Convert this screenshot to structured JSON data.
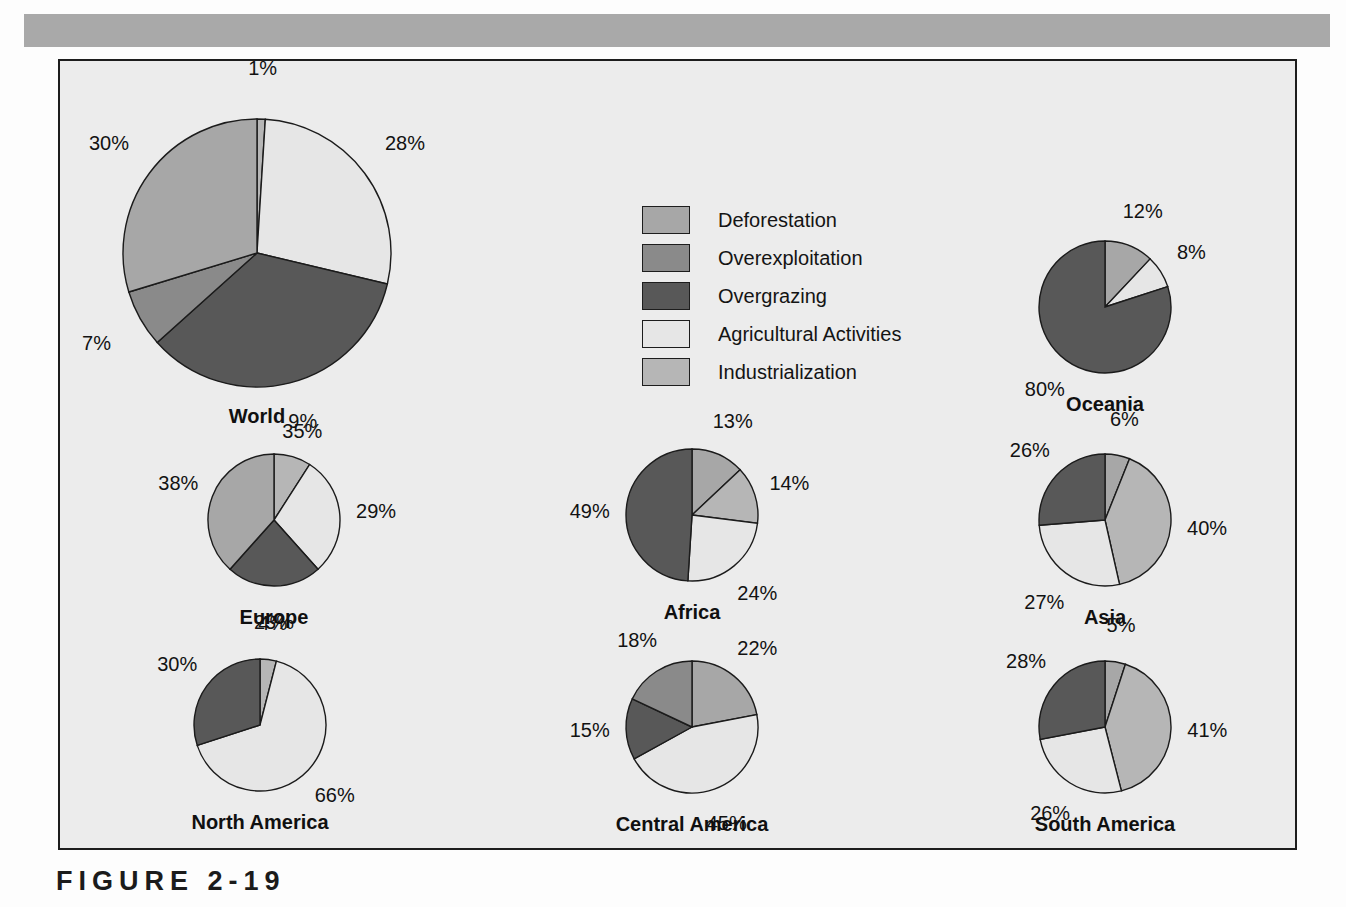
{
  "caption": "FIGURE 2-19",
  "colors": {
    "page_background": "#fdfdfd",
    "panel_background": "#ececec",
    "top_band": "#a9a9a9",
    "frame_border": "#1d1d1d",
    "deforestation": "#a7a7a7",
    "overexploitation": "#8a8a8a",
    "overgrazing": "#585858",
    "agricultural": "#e6e6e6",
    "industrialization": "#b6b6b6"
  },
  "legend": {
    "items": [
      {
        "label": "Deforestation",
        "color": "#a7a7a7"
      },
      {
        "label": "Overexploitation",
        "color": "#8a8a8a"
      },
      {
        "label": "Overgrazing",
        "color": "#585858"
      },
      {
        "label": "Agricultural Activities",
        "color": "#e6e6e6"
      },
      {
        "label": "Industrialization",
        "color": "#b6b6b6"
      }
    ]
  },
  "chart_data": {
    "type": "pie",
    "title": "FIGURE 2-19",
    "xlabel": "",
    "ylabel": "",
    "grid": false,
    "legend_position": "top-center",
    "units": "percent",
    "categories": [
      "Deforestation",
      "Overexploitation",
      "Overgrazing",
      "Agricultural Activities",
      "Industrialization"
    ],
    "charts": [
      {
        "name": "World",
        "slices": [
          {
            "label": "1%",
            "value": 1,
            "category": "Industrialization"
          },
          {
            "label": "28%",
            "value": 28,
            "category": "Agricultural Activities"
          },
          {
            "label": "35%",
            "value": 35,
            "category": "Overgrazing"
          },
          {
            "label": "7%",
            "value": 7,
            "category": "Overexploitation"
          },
          {
            "label": "30%",
            "value": 30,
            "category": "Deforestation"
          }
        ]
      },
      {
        "name": "Oceania",
        "slices": [
          {
            "label": "12%",
            "value": 12,
            "category": "Deforestation"
          },
          {
            "label": "8%",
            "value": 8,
            "category": "Agricultural Activities"
          },
          {
            "label": "80%",
            "value": 80,
            "category": "Overgrazing"
          }
        ]
      },
      {
        "name": "Europe",
        "slices": [
          {
            "label": "9%",
            "value": 9,
            "category": "Industrialization"
          },
          {
            "label": "29%",
            "value": 29,
            "category": "Agricultural Activities"
          },
          {
            "label": "23%",
            "value": 23,
            "category": "Overgrazing"
          },
          {
            "label": "38%",
            "value": 38,
            "category": "Deforestation"
          }
        ]
      },
      {
        "name": "Africa",
        "slices": [
          {
            "label": "13%",
            "value": 13,
            "category": "Deforestation"
          },
          {
            "label": "14%",
            "value": 14,
            "category": "Industrialization"
          },
          {
            "label": "24%",
            "value": 24,
            "category": "Agricultural Activities"
          },
          {
            "label": "49%",
            "value": 49,
            "category": "Overgrazing"
          }
        ]
      },
      {
        "name": "Asia",
        "slices": [
          {
            "label": "6%",
            "value": 6,
            "category": "Deforestation"
          },
          {
            "label": "40%",
            "value": 40,
            "category": "Industrialization"
          },
          {
            "label": "27%",
            "value": 27,
            "category": "Agricultural Activities"
          },
          {
            "label": "26%",
            "value": 26,
            "category": "Overgrazing"
          }
        ]
      },
      {
        "name": "North America",
        "slices": [
          {
            "label": "4%",
            "value": 4,
            "category": "Industrialization"
          },
          {
            "label": "66%",
            "value": 66,
            "category": "Agricultural Activities"
          },
          {
            "label": "30%",
            "value": 30,
            "category": "Overgrazing"
          }
        ]
      },
      {
        "name": "Central America",
        "slices": [
          {
            "label": "22%",
            "value": 22,
            "category": "Deforestation"
          },
          {
            "label": "45%",
            "value": 45,
            "category": "Agricultural Activities"
          },
          {
            "label": "15%",
            "value": 15,
            "category": "Overgrazing"
          },
          {
            "label": "18%",
            "value": 18,
            "category": "Overexploitation"
          }
        ]
      },
      {
        "name": "South America",
        "slices": [
          {
            "label": "5%",
            "value": 5,
            "category": "Deforestation"
          },
          {
            "label": "41%",
            "value": 41,
            "category": "Industrialization"
          },
          {
            "label": "26%",
            "value": 26,
            "category": "Agricultural Activities"
          },
          {
            "label": "28%",
            "value": 28,
            "category": "Overgrazing"
          }
        ]
      }
    ]
  },
  "layout": {
    "pies": [
      {
        "name": "World",
        "cx": 255,
        "cy": 251,
        "r": 134,
        "label_r": 1.3,
        "title_dy": 152
      },
      {
        "name": "Oceania",
        "cx": 1103,
        "cy": 305,
        "r": 66,
        "label_r": 1.4,
        "title_dy": 86
      },
      {
        "name": "Europe",
        "cx": 272,
        "cy": 518,
        "r": 66,
        "label_r": 1.4,
        "title_dy": 86
      },
      {
        "name": "Africa",
        "cx": 690,
        "cy": 513,
        "r": 66,
        "label_r": 1.4,
        "title_dy": 86
      },
      {
        "name": "Asia",
        "cx": 1103,
        "cy": 518,
        "r": 66,
        "label_r": 1.4,
        "title_dy": 86
      },
      {
        "name": "North America",
        "cx": 258,
        "cy": 723,
        "r": 66,
        "label_r": 1.4,
        "title_dy": 86
      },
      {
        "name": "Central America",
        "cx": 690,
        "cy": 725,
        "r": 66,
        "label_r": 1.4,
        "title_dy": 86
      },
      {
        "name": "South America",
        "cx": 1103,
        "cy": 725,
        "r": 66,
        "label_r": 1.4,
        "title_dy": 86
      }
    ]
  }
}
